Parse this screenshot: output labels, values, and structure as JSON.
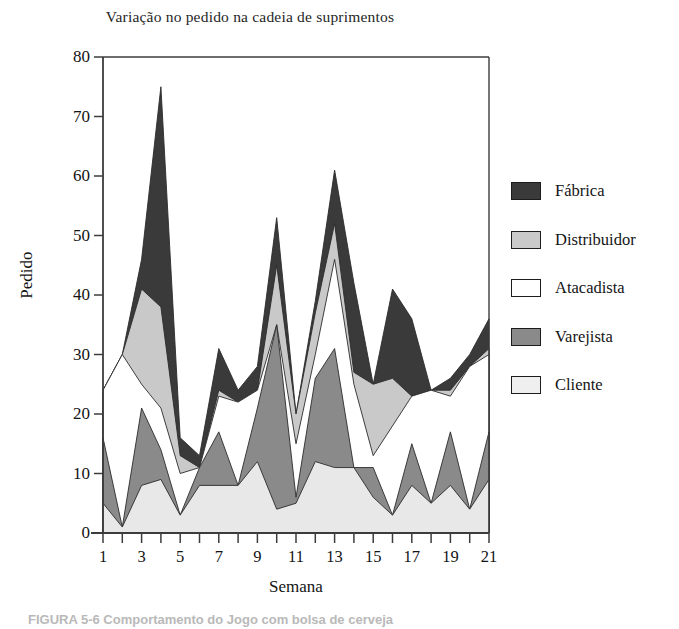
{
  "chart_data": {
    "type": "area",
    "title": "Variação no pedido na cadeia de suprimentos",
    "xlabel": "Semana",
    "ylabel": "Pedido",
    "xlim": [
      1,
      21
    ],
    "ylim": [
      0,
      80
    ],
    "ytick_values": [
      0,
      10,
      20,
      30,
      40,
      50,
      60,
      70,
      80
    ],
    "xtick_values": [
      1,
      2,
      3,
      4,
      5,
      6,
      7,
      8,
      9,
      10,
      11,
      12,
      13,
      14,
      15,
      16,
      17,
      18,
      19,
      20,
      21
    ],
    "xtick_labels_shown": [
      1,
      3,
      5,
      7,
      9,
      11,
      13,
      15,
      17,
      19,
      21
    ],
    "grid": false,
    "legend_position": "right",
    "x": [
      1,
      2,
      3,
      4,
      5,
      6,
      7,
      8,
      9,
      10,
      11,
      12,
      13,
      14,
      15,
      16,
      17,
      18,
      19,
      20,
      21
    ],
    "series": [
      {
        "name": "Fábrica",
        "color": "#3a3a3a",
        "values": [
          24,
          30,
          46,
          75,
          16,
          13,
          31,
          24,
          28,
          53,
          20,
          39,
          61,
          42,
          25,
          41,
          36,
          24,
          26,
          30,
          36
        ]
      },
      {
        "name": "Distribuidor",
        "color": "#c9c9c9",
        "values": [
          24,
          30,
          41,
          38,
          13,
          11,
          24,
          22,
          24,
          45,
          20,
          37,
          52,
          27,
          25,
          26,
          23,
          24,
          24,
          28,
          31
        ]
      },
      {
        "name": "Atacadista",
        "color": "#ffffff",
        "values": [
          24,
          30,
          25,
          21,
          10,
          11,
          23,
          22,
          24,
          35,
          15,
          30,
          46,
          25,
          13,
          18,
          23,
          24,
          23,
          28,
          30
        ]
      },
      {
        "name": "Varejista",
        "color": "#8a8a8a",
        "values": [
          16,
          1,
          21,
          14,
          3,
          11,
          17,
          8,
          21,
          35,
          6,
          26,
          31,
          11,
          11,
          3,
          15,
          5,
          17,
          4,
          17
        ]
      },
      {
        "name": "Cliente",
        "color": "#e8e8e8",
        "values": [
          5,
          1,
          8,
          9,
          3,
          8,
          8,
          8,
          12,
          4,
          5,
          12,
          11,
          11,
          6,
          3,
          8,
          5,
          8,
          4,
          9
        ]
      }
    ]
  },
  "legend": {
    "items": [
      {
        "label": "Fábrica",
        "color": "#3a3a3a"
      },
      {
        "label": "Distribuidor",
        "color": "#c9c9c9"
      },
      {
        "label": "Atacadista",
        "color": "#ffffff"
      },
      {
        "label": "Varejista",
        "color": "#8a8a8a"
      },
      {
        "label": "Cliente",
        "color": "#efefef"
      }
    ]
  },
  "caption": "FIGURA 5-6  Comportamento do Jogo com bolsa de cerveja",
  "colors": {
    "axis": "#3c3c3c",
    "text": "#141414",
    "plot_background": "#ffffff"
  }
}
